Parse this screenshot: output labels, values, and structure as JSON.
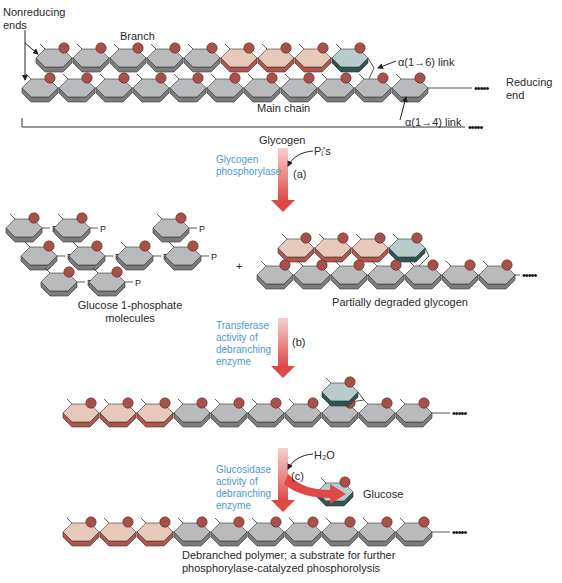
{
  "colors": {
    "gray_top": "#b9babb",
    "gray_side": "#7b7c7e",
    "pink_top": "#e8c8b8",
    "pink_side": "#b2554a",
    "teal_top": "#b8cccb",
    "teal_side": "#2e5552",
    "o_circle": "#a8504a",
    "arrow": "#e04848",
    "enzyme_text": "#4a9ccf"
  },
  "top": {
    "nonreducing_ends": [
      "Nonreducing",
      "ends"
    ],
    "branch_label": "Branch",
    "link_16": "α(1→6) link",
    "link_14": "α(1→4) link",
    "main_chain": "Main chain",
    "reducing_end": [
      "Reducing",
      "end"
    ],
    "glycogen": "Glycogen",
    "branch_units": [
      "gray",
      "gray",
      "gray",
      "gray",
      "gray",
      "pink",
      "pink",
      "pink",
      "teal"
    ],
    "main_units": [
      "gray",
      "gray",
      "gray",
      "gray",
      "gray",
      "gray",
      "gray",
      "gray",
      "gray",
      "gray",
      "gray"
    ]
  },
  "step_a": {
    "enzyme": [
      "Glycogen",
      "phosphorylase"
    ],
    "reagent": "Pᵢ's",
    "letter": "(a)"
  },
  "products_a": {
    "g1p_count": 9,
    "phosphate_label": "P",
    "g1p_caption": [
      "Glucose 1-phosphate",
      "molecules"
    ],
    "plus": "+",
    "partial_caption": "Partially degraded glycogen",
    "branch_units": [
      "pink",
      "pink",
      "pink",
      "teal"
    ],
    "main_units": [
      "gray",
      "gray",
      "gray",
      "gray",
      "gray",
      "gray",
      "gray"
    ]
  },
  "step_b": {
    "enzyme": [
      "Transferase",
      "activity of",
      "debranching",
      "enzyme"
    ],
    "letter": "(b)"
  },
  "products_b": {
    "main_units": [
      "pink",
      "pink",
      "pink",
      "gray",
      "gray",
      "gray",
      "gray",
      "gray",
      "gray",
      "gray"
    ],
    "branch_unit": "teal"
  },
  "step_c": {
    "enzyme": [
      "Glucosidase",
      "activity of",
      "debranching",
      "enzyme"
    ],
    "reagent": "H₂O",
    "letter": "(c)",
    "released": "Glucose"
  },
  "final": {
    "main_units": [
      "pink",
      "pink",
      "pink",
      "gray",
      "gray",
      "gray",
      "gray",
      "gray",
      "gray",
      "gray"
    ],
    "caption": [
      "Debranched polymer; a substrate for further",
      "phosphorylase-catalyzed phosphorolysis"
    ]
  },
  "ellipsis": "•••••"
}
